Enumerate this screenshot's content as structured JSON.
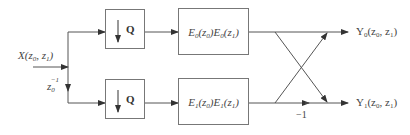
{
  "input": {
    "label_main": "X(z",
    "label_sub0": "0",
    "label_mid": ", z",
    "label_sub1": "1",
    "label_end": ")",
    "delay_base": "z",
    "delay_sub": "0",
    "delay_sup": "−1"
  },
  "branches": [
    {
      "decimator_label": "Q",
      "filter": {
        "p1": "E",
        "s1": "0",
        "p2": "(z",
        "s2": "0",
        "p3": ")E",
        "s3": "0",
        "p4": "(z",
        "s4": "1",
        "p5": ")"
      },
      "output": {
        "p1": "Y",
        "s1": "0",
        "p2": "(z",
        "s2": "0",
        "p3": ", z",
        "s3": "1",
        "p4": ")"
      }
    },
    {
      "decimator_label": "Q",
      "filter": {
        "p1": "E",
        "s1": "1",
        "p2": "(z",
        "s2": "0",
        "p3": ")E",
        "s3": "1",
        "p4": "(z",
        "s4": "1",
        "p5": ")"
      },
      "output": {
        "p1": "Y",
        "s1": "1",
        "p2": "(z",
        "s2": "0",
        "p3": ", z",
        "s3": "1",
        "p4": ")"
      }
    }
  ],
  "butterfly": {
    "gain_label": "−1"
  },
  "colors": {
    "line": "#555555",
    "box_border": "#777777",
    "text": "#444444"
  }
}
